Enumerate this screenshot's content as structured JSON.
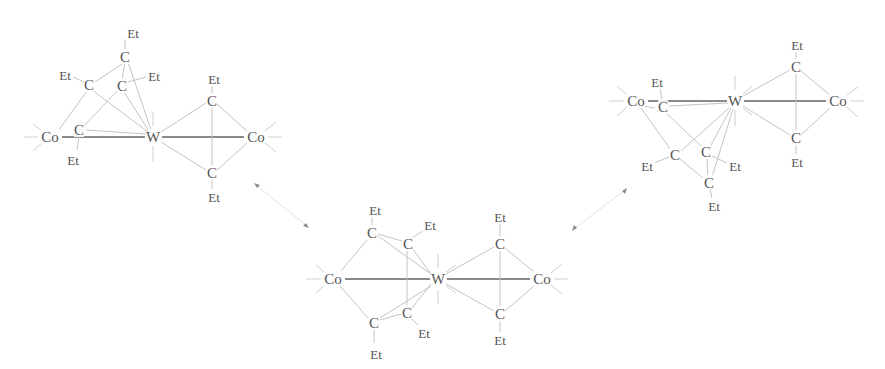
{
  "figure": {
    "labels": {
      "metal_w": "W",
      "metal_co": "Co",
      "carbon": "C",
      "ethyl": "Et"
    },
    "arrows": [
      {
        "from": "left-structure",
        "to": "middle-structure",
        "type": "double-headed"
      },
      {
        "from": "middle-structure",
        "to": "right-structure",
        "type": "double-headed"
      }
    ]
  },
  "structures": [
    {
      "id": "left",
      "atoms": [
        {
          "label": "Co",
          "x": 50,
          "y": 137
        },
        {
          "label": "W",
          "x": 153,
          "y": 137
        },
        {
          "label": "Co",
          "x": 256,
          "y": 137
        },
        {
          "label": "C",
          "x": 125,
          "y": 57
        },
        {
          "label": "Et",
          "x": 133,
          "y": 33
        },
        {
          "label": "C",
          "x": 89,
          "y": 85
        },
        {
          "label": "Et",
          "x": 65,
          "y": 75
        },
        {
          "label": "C",
          "x": 122,
          "y": 86
        },
        {
          "label": "Et",
          "x": 154,
          "y": 76
        },
        {
          "label": "C",
          "x": 79,
          "y": 130
        },
        {
          "label": "Et",
          "x": 73,
          "y": 160
        },
        {
          "label": "C",
          "x": 212,
          "y": 101
        },
        {
          "label": "Et",
          "x": 214,
          "y": 79
        },
        {
          "label": "C",
          "x": 212,
          "y": 173
        },
        {
          "label": "Et",
          "x": 214,
          "y": 197
        }
      ]
    },
    {
      "id": "middle",
      "atoms": [
        {
          "label": "Co",
          "x": 333,
          "y": 279
        },
        {
          "label": "W",
          "x": 438,
          "y": 279
        },
        {
          "label": "Co",
          "x": 542,
          "y": 279
        },
        {
          "label": "C",
          "x": 372,
          "y": 233
        },
        {
          "label": "Et",
          "x": 375,
          "y": 210
        },
        {
          "label": "C",
          "x": 408,
          "y": 244
        },
        {
          "label": "Et",
          "x": 430,
          "y": 225
        },
        {
          "label": "C",
          "x": 374,
          "y": 323
        },
        {
          "label": "Et",
          "x": 376,
          "y": 354
        },
        {
          "label": "C",
          "x": 407,
          "y": 313
        },
        {
          "label": "Et",
          "x": 424,
          "y": 333
        },
        {
          "label": "C",
          "x": 500,
          "y": 244
        },
        {
          "label": "Et",
          "x": 500,
          "y": 217
        },
        {
          "label": "C",
          "x": 500,
          "y": 314
        },
        {
          "label": "Et",
          "x": 500,
          "y": 340
        }
      ]
    },
    {
      "id": "right",
      "atoms": [
        {
          "label": "Co",
          "x": 636,
          "y": 101
        },
        {
          "label": "W",
          "x": 735,
          "y": 101
        },
        {
          "label": "Co",
          "x": 838,
          "y": 101
        },
        {
          "label": "C",
          "x": 663,
          "y": 107
        },
        {
          "label": "Et",
          "x": 657,
          "y": 82
        },
        {
          "label": "C",
          "x": 796,
          "y": 67
        },
        {
          "label": "Et",
          "x": 797,
          "y": 45
        },
        {
          "label": "C",
          "x": 796,
          "y": 138
        },
        {
          "label": "Et",
          "x": 797,
          "y": 162
        },
        {
          "label": "C",
          "x": 675,
          "y": 155
        },
        {
          "label": "Et",
          "x": 647,
          "y": 166
        },
        {
          "label": "C",
          "x": 706,
          "y": 152
        },
        {
          "label": "Et",
          "x": 735,
          "y": 166
        },
        {
          "label": "C",
          "x": 709,
          "y": 183
        },
        {
          "label": "Et",
          "x": 714,
          "y": 206
        }
      ]
    }
  ]
}
